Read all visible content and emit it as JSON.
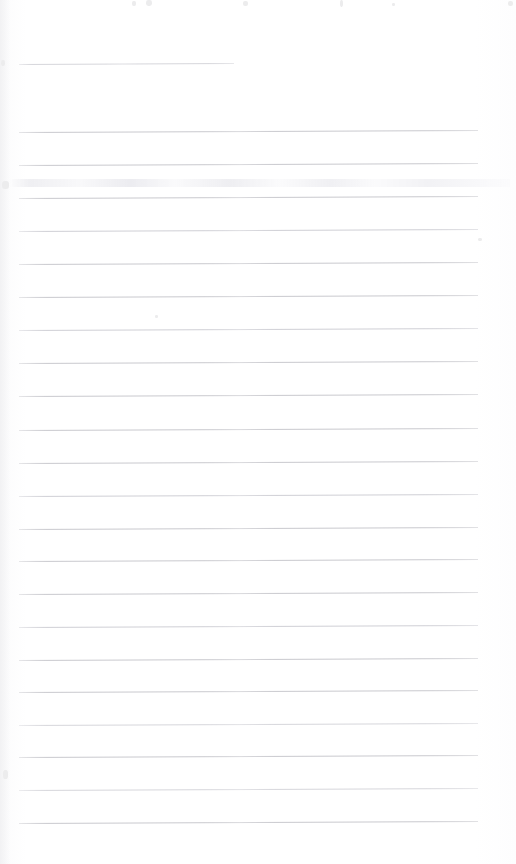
{
  "document": {
    "kind": "scanned-ruled-notebook-page",
    "title": "Blank Ruled Page",
    "page_width": 516,
    "page_height": 864,
    "background_color": "#ffffff",
    "content_text": "",
    "handwriting_present": "no",
    "printed_text_present": "no"
  },
  "ruling": {
    "line_color": "#c9c9ce",
    "line_color_faint": "#d6d6db",
    "line_thickness_px": 1,
    "line_spacing_px": 32.8,
    "left_margin_px": 19,
    "right_end_px": 478,
    "tilt_degrees": -0.25,
    "total_lines": 23,
    "header_rule_label": "header-rule",
    "header_rule_left_px": 19,
    "header_rule_right_px": 234,
    "header_rule_y_px": 64,
    "body_first_line_y_px": 132,
    "body_last_line_y_px": 823
  },
  "lines": [
    {
      "id": "header-rule",
      "y": 64,
      "x1": 19,
      "x2": 234,
      "tone": "faint"
    },
    {
      "id": "rule-01",
      "y": 132,
      "x1": 19,
      "x2": 478,
      "tone": "normal"
    },
    {
      "id": "rule-02",
      "y": 165,
      "x1": 19,
      "x2": 478,
      "tone": "normal"
    },
    {
      "id": "rule-03",
      "y": 198,
      "x1": 19,
      "x2": 478,
      "tone": "normal"
    },
    {
      "id": "rule-04",
      "y": 231,
      "x1": 19,
      "x2": 478,
      "tone": "soft"
    },
    {
      "id": "rule-05",
      "y": 264,
      "x1": 19,
      "x2": 478,
      "tone": "normal"
    },
    {
      "id": "rule-06",
      "y": 297,
      "x1": 19,
      "x2": 478,
      "tone": "normal"
    },
    {
      "id": "rule-07",
      "y": 330,
      "x1": 19,
      "x2": 478,
      "tone": "soft"
    },
    {
      "id": "rule-08",
      "y": 363,
      "x1": 19,
      "x2": 478,
      "tone": "normal"
    },
    {
      "id": "rule-09",
      "y": 396,
      "x1": 19,
      "x2": 478,
      "tone": "normal"
    },
    {
      "id": "rule-10",
      "y": 430,
      "x1": 19,
      "x2": 478,
      "tone": "normal"
    },
    {
      "id": "rule-11",
      "y": 463,
      "x1": 19,
      "x2": 478,
      "tone": "normal"
    },
    {
      "id": "rule-12",
      "y": 496,
      "x1": 19,
      "x2": 478,
      "tone": "soft"
    },
    {
      "id": "rule-13",
      "y": 529,
      "x1": 19,
      "x2": 478,
      "tone": "normal"
    },
    {
      "id": "rule-14",
      "y": 561,
      "x1": 19,
      "x2": 478,
      "tone": "normal"
    },
    {
      "id": "rule-15",
      "y": 594,
      "x1": 19,
      "x2": 478,
      "tone": "normal"
    },
    {
      "id": "rule-16",
      "y": 627,
      "x1": 19,
      "x2": 478,
      "tone": "soft"
    },
    {
      "id": "rule-17",
      "y": 660,
      "x1": 19,
      "x2": 478,
      "tone": "normal"
    },
    {
      "id": "rule-18",
      "y": 692,
      "x1": 19,
      "x2": 478,
      "tone": "normal"
    },
    {
      "id": "rule-19",
      "y": 725,
      "x1": 19,
      "x2": 478,
      "tone": "faint"
    },
    {
      "id": "rule-20",
      "y": 757,
      "x1": 19,
      "x2": 478,
      "tone": "normal"
    },
    {
      "id": "rule-21",
      "y": 790,
      "x1": 19,
      "x2": 478,
      "tone": "faint"
    },
    {
      "id": "rule-22",
      "y": 823,
      "x1": 19,
      "x2": 478,
      "tone": "normal"
    }
  ],
  "artifacts": {
    "smudge_band": {
      "label": "bleed-through-smudge",
      "x": 10,
      "y": 179,
      "width": 500,
      "height": 8,
      "color": "#e4e4e9"
    },
    "specks": [
      {
        "x": 132,
        "y": 1,
        "w": 4,
        "h": 5
      },
      {
        "x": 146,
        "y": 0,
        "w": 6,
        "h": 6
      },
      {
        "x": 243,
        "y": 1,
        "w": 5,
        "h": 5
      },
      {
        "x": 340,
        "y": 0,
        "w": 3,
        "h": 7
      },
      {
        "x": 392,
        "y": 3,
        "w": 3,
        "h": 3
      },
      {
        "x": 508,
        "y": 1,
        "w": 5,
        "h": 5
      },
      {
        "x": 2,
        "y": 181,
        "w": 7,
        "h": 8
      },
      {
        "x": 1,
        "y": 60,
        "w": 4,
        "h": 6
      },
      {
        "x": 478,
        "y": 238,
        "w": 4,
        "h": 3
      },
      {
        "x": 155,
        "y": 315,
        "w": 3,
        "h": 3
      },
      {
        "x": 3,
        "y": 770,
        "w": 5,
        "h": 9
      }
    ]
  }
}
